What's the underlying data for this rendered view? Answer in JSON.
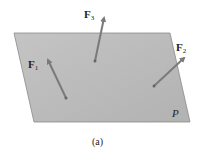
{
  "diagram": {
    "plane": {
      "label": "P",
      "fill": "#bdbdbd",
      "edge": "#8a8a8a",
      "vertices": [
        [
          14,
          33
        ],
        [
          170,
          33
        ],
        [
          190,
          122
        ],
        [
          34,
          122
        ]
      ]
    },
    "forces": [
      {
        "name": "F",
        "sub": "1",
        "tail": [
          66,
          98
        ],
        "head": [
          47,
          58
        ],
        "label_pos": [
          29,
          67
        ]
      },
      {
        "name": "F",
        "sub": "2",
        "tail": [
          154,
          86
        ],
        "head": [
          186,
          56
        ],
        "label_pos": [
          176,
          50
        ]
      },
      {
        "name": "F",
        "sub": "3",
        "tail": [
          95,
          61
        ],
        "head": [
          105,
          16
        ],
        "label_pos": [
          84,
          17
        ]
      }
    ],
    "arrow_color": "#7a7a7a",
    "caption": "(a)"
  }
}
